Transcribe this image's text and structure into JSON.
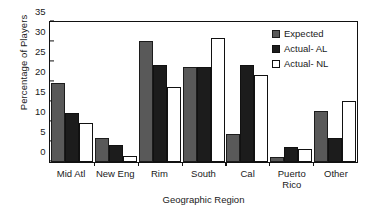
{
  "chart_data": {
    "type": "bar",
    "title": "",
    "xlabel": "Geographic Region",
    "ylabel": "Percentage of Players",
    "categories": [
      "Mid Atl",
      "New Eng",
      "Rim",
      "South",
      "Cal",
      "Puerto Rico",
      "Other"
    ],
    "series": [
      {
        "name": "Expected",
        "color": "#595959",
        "values": [
          19.5,
          6.0,
          29.8,
          23.5,
          7.0,
          1.2,
          12.5
        ]
      },
      {
        "name": "Actual- AL",
        "color": "#1c1c1c",
        "values": [
          12.0,
          4.2,
          24.0,
          23.5,
          24.0,
          3.8,
          6.0
        ]
      },
      {
        "name": "Actual- NL",
        "color": "#ffffff",
        "values": [
          9.5,
          1.5,
          18.5,
          30.5,
          21.5,
          3.2,
          15.0
        ]
      }
    ],
    "ylim": [
      0,
      35
    ],
    "yticks": [
      0,
      5,
      10,
      15,
      20,
      25,
      30,
      35
    ],
    "ytick_labels": [
      "0",
      "5",
      "10",
      "15",
      "20",
      "25",
      "30",
      "35"
    ],
    "grid": false,
    "legend_position": "top-right"
  },
  "legend": {
    "items": [
      {
        "label": "Expected"
      },
      {
        "label": "Actual- AL"
      },
      {
        "label": "Actual- NL"
      }
    ]
  }
}
